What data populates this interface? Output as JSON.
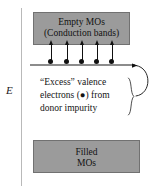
{
  "figure": {
    "type": "energy-band-diagram",
    "axis": {
      "label": "E",
      "orientation": "vertical",
      "meaning": "energy-increasing-upward"
    },
    "bands": {
      "conduction": {
        "line1": "Empty MOs",
        "line2": "(Conduction bands)",
        "fill_color": "#9b9b9b"
      },
      "valence": {
        "line1": "Filled",
        "line2": "MOs",
        "fill_color": "#9b9b9b"
      }
    },
    "donor_level": {
      "electron_count": 5,
      "electron_color": "#111111",
      "arrow_count": 5
    },
    "annotation": {
      "line1": "“Excess” valence",
      "line2": "electrons (●) from",
      "line3": "donor impurity"
    }
  }
}
